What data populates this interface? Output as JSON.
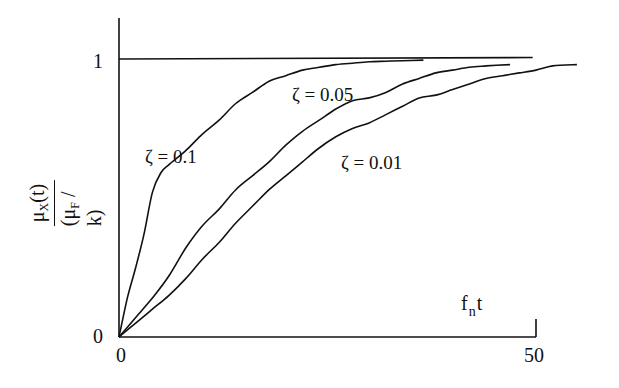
{
  "chart_data": {
    "type": "line",
    "title": "",
    "xlabel": "f_n t",
    "ylabel": "μ_X(t) / (μ_F / k)",
    "ylabel_parts": {
      "numerator": "μ",
      "numerator_sub": "X",
      "numerator_tail": "(t)",
      "denominator_head": "(μ",
      "denominator_sub": "F",
      "denominator_tail": " / k)"
    },
    "xlabel_parts": {
      "head": "f",
      "sub": "n",
      "tail": "t"
    },
    "x_ticks": [
      "0",
      "50"
    ],
    "y_ticks": [
      "0",
      "1"
    ],
    "xlim": [
      0,
      50
    ],
    "ylim": [
      0,
      1.15
    ],
    "grid": false,
    "legend": "inline curve labels",
    "reference_line": {
      "y": 1,
      "x_range": [
        0,
        49.6
      ]
    },
    "series": [
      {
        "name": "ζ = 0.1",
        "x": [
          0,
          1,
          2,
          3,
          4,
          5,
          6,
          8,
          10,
          12,
          14,
          16,
          18,
          20,
          22,
          24,
          26,
          28,
          30,
          32,
          34,
          36.5
        ],
        "y": [
          0,
          0.14,
          0.25,
          0.37,
          0.52,
          0.59,
          0.62,
          0.67,
          0.73,
          0.78,
          0.84,
          0.88,
          0.92,
          0.94,
          0.96,
          0.97,
          0.98,
          0.985,
          0.99,
          0.992,
          0.994,
          0.996
        ]
      },
      {
        "name": "ζ = 0.05",
        "x": [
          0,
          2,
          4,
          6,
          8,
          10,
          12,
          14,
          16,
          18,
          20,
          22,
          24,
          26,
          28,
          30,
          32,
          34,
          36,
          38,
          40,
          42,
          44,
          46.9
        ],
        "y": [
          0,
          0.07,
          0.14,
          0.22,
          0.32,
          0.4,
          0.46,
          0.53,
          0.58,
          0.63,
          0.69,
          0.74,
          0.78,
          0.82,
          0.85,
          0.86,
          0.88,
          0.91,
          0.93,
          0.95,
          0.96,
          0.97,
          0.975,
          0.98
        ]
      },
      {
        "name": "ζ = 0.01",
        "x": [
          0,
          2,
          4,
          6,
          8,
          10,
          12,
          14,
          16,
          18,
          20,
          22,
          24,
          26,
          28,
          30,
          32,
          34,
          36,
          38,
          40,
          42,
          44,
          46,
          48,
          50,
          52,
          54.9
        ],
        "y": [
          0,
          0.05,
          0.1,
          0.15,
          0.21,
          0.28,
          0.34,
          0.41,
          0.47,
          0.53,
          0.58,
          0.63,
          0.68,
          0.72,
          0.75,
          0.77,
          0.8,
          0.83,
          0.86,
          0.87,
          0.89,
          0.91,
          0.93,
          0.94,
          0.95,
          0.96,
          0.975,
          0.98
        ]
      }
    ],
    "annotations": [
      {
        "text": "ζ = 0.1",
        "near_series": "ζ = 0.1"
      },
      {
        "text": "ζ = 0.05",
        "near_series": "ζ = 0.05"
      },
      {
        "text": "ζ = 0.01",
        "near_series": "ζ = 0.01"
      }
    ]
  },
  "plot": {
    "origin_px": [
      119,
      337
    ],
    "px_per_x_unit": 8.34,
    "px_per_y_unit": 278,
    "axis_top_px": 18,
    "x_end_px": 536,
    "tick_top_px": 319,
    "line_color": "#111111",
    "background": "#ffffff"
  }
}
